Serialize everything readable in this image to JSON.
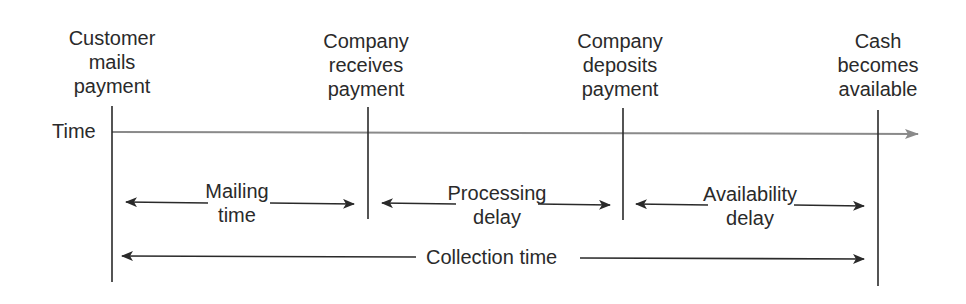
{
  "diagram": {
    "axis_label": "Time",
    "axis_color": "#8a8a8a",
    "line_color": "#2a2a2a",
    "events": [
      {
        "label": "Customer\nmails\npayment",
        "x": 112
      },
      {
        "label": "Company\nreceives\npayment",
        "x": 368
      },
      {
        "label": "Company\ndeposits\npayment",
        "x": 623
      },
      {
        "label": "Cash\nbecomes\navailable",
        "x": 878
      }
    ],
    "intervals": [
      {
        "label": "Mailing\ntime",
        "from": 0,
        "to": 1
      },
      {
        "label": "Processing\ndelay",
        "from": 1,
        "to": 2
      },
      {
        "label": "Availability\ndelay",
        "from": 2,
        "to": 3
      }
    ],
    "total": {
      "label": "Collection time",
      "from": 0,
      "to": 3
    }
  }
}
